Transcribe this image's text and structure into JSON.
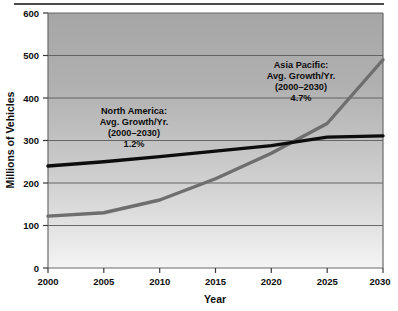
{
  "chart_data": {
    "type": "line",
    "title": "",
    "xlabel": "Year",
    "ylabel": "Millions of Vehicles",
    "x": [
      2000,
      2005,
      2010,
      2015,
      2020,
      2025,
      2030
    ],
    "xtick_labels": [
      "2000",
      "2005",
      "2010",
      "2015",
      "2020",
      "2025",
      "2030"
    ],
    "ytick_labels": [
      "0",
      "100",
      "200",
      "300",
      "400",
      "500",
      "600"
    ],
    "yticks": [
      0,
      100,
      200,
      300,
      400,
      500,
      600
    ],
    "xlim": [
      2000,
      2030
    ],
    "ylim": [
      0,
      600
    ],
    "grid": "horizontal",
    "legend": "none",
    "series": [
      {
        "name": "North America",
        "color": "#0d0d0d",
        "values": [
          240,
          250,
          262,
          275,
          288,
          308,
          311
        ]
      },
      {
        "name": "Asia Pacific",
        "color": "#6e6e6e",
        "values": [
          122,
          130,
          160,
          210,
          270,
          340,
          490
        ]
      }
    ],
    "annotations": [
      {
        "name": "north-america-annotation",
        "lines": [
          "North America:",
          "Avg. Growth/Yr.",
          "(2000–2030)",
          "1.2%"
        ],
        "series": "North America",
        "growth_rate": "1.2%",
        "period": "(2000–2030)"
      },
      {
        "name": "asia-pacific-annotation",
        "lines": [
          "Asia Pacific:",
          "Avg. Growth/Yr.",
          "(2000–2030)",
          "4.7%"
        ],
        "series": "Asia Pacific",
        "growth_rate": "4.7%",
        "period": "(2000–2030)"
      }
    ]
  },
  "axes": {
    "y_title": "Millions of Vehicles",
    "x_title": "Year",
    "y_ticks": {
      "t0": "0",
      "t1": "100",
      "t2": "200",
      "t3": "300",
      "t4": "400",
      "t5": "500",
      "t6": "600"
    },
    "x_ticks": {
      "t0": "2000",
      "t1": "2005",
      "t2": "2010",
      "t3": "2015",
      "t4": "2020",
      "t5": "2025",
      "t6": "2030"
    }
  },
  "annotations": {
    "north_america": {
      "l0": "North America:",
      "l1": "Avg. Growth/Yr.",
      "l2": "(2000–2030)",
      "l3": "1.2%"
    },
    "asia_pacific": {
      "l0": "Asia Pacific:",
      "l1": "Avg. Growth/Yr.",
      "l2": "(2000–2030)",
      "l3": "4.7%"
    }
  },
  "colors": {
    "north_america_line": "#0d0d0d",
    "asia_pacific_line": "#6e6e6e",
    "plot_bg_top": "#a9a9a9",
    "plot_bg_bottom": "#f2f2f2",
    "gridline": "#555555",
    "axis": "#6a6a6a"
  }
}
